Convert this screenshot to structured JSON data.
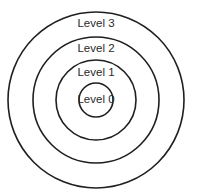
{
  "diagram": {
    "type": "concentric-circles",
    "center": {
      "x": 96,
      "y": 100
    },
    "colors": {
      "stroke": "#1f1f1f",
      "text": "#2a2a2a",
      "background": "#ffffff"
    },
    "levels": [
      {
        "label": "Level 3",
        "radius": 88,
        "label_y": 27
      },
      {
        "label": "Level 2",
        "radius": 63,
        "label_y": 52
      },
      {
        "label": "Level 1",
        "radius": 40,
        "label_y": 76
      },
      {
        "label": "Level 0",
        "radius": 17,
        "label_y": 103
      }
    ]
  }
}
